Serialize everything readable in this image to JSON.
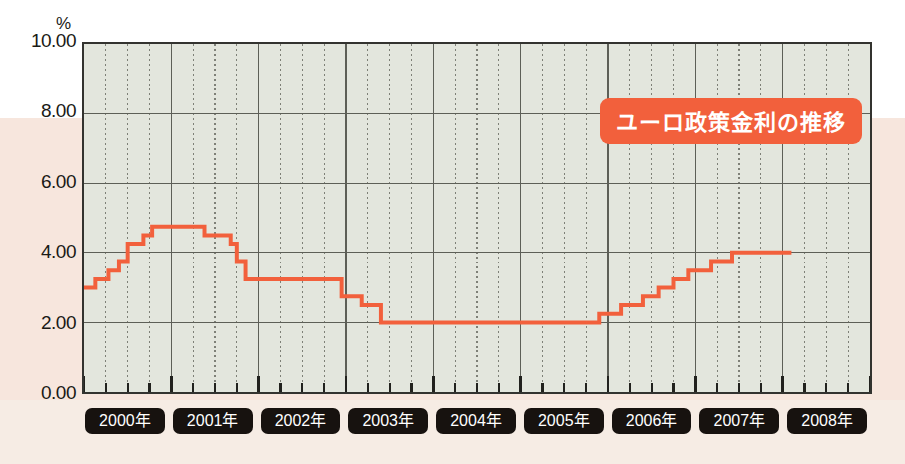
{
  "chart_data": {
    "type": "line",
    "title": "ユーロ政策金利の推移",
    "ylabel": "%",
    "xlabel": "",
    "ylim": [
      0,
      10
    ],
    "yticks": [
      0,
      2,
      4,
      6,
      8,
      10
    ],
    "ytick_labels": [
      "0.00",
      "2.00",
      "4.00",
      "6.00",
      "8.00",
      "10.00"
    ],
    "xlim": [
      2000,
      2009
    ],
    "grid": true,
    "grid_minor": "quarterly",
    "legend": "none",
    "line_color": "#f2603c",
    "plot_background": "#e3e6dd",
    "step_style": "post",
    "categories": [
      "2000年",
      "2001年",
      "2002年",
      "2003年",
      "2004年",
      "2005年",
      "2006年",
      "2007年",
      "2008年"
    ],
    "series": [
      {
        "name": "ユーロ政策金利",
        "unit": "%",
        "points": [
          {
            "x": 2000.0,
            "y": 3.0
          },
          {
            "x": 2000.13,
            "y": 3.25
          },
          {
            "x": 2000.28,
            "y": 3.5
          },
          {
            "x": 2000.4,
            "y": 3.75
          },
          {
            "x": 2000.5,
            "y": 4.25
          },
          {
            "x": 2000.68,
            "y": 4.5
          },
          {
            "x": 2000.78,
            "y": 4.75
          },
          {
            "x": 2001.38,
            "y": 4.5
          },
          {
            "x": 2001.68,
            "y": 4.25
          },
          {
            "x": 2001.75,
            "y": 3.75
          },
          {
            "x": 2001.85,
            "y": 3.25
          },
          {
            "x": 2002.95,
            "y": 2.75
          },
          {
            "x": 2003.18,
            "y": 2.5
          },
          {
            "x": 2003.4,
            "y": 2.0
          },
          {
            "x": 2005.9,
            "y": 2.25
          },
          {
            "x": 2006.15,
            "y": 2.5
          },
          {
            "x": 2006.4,
            "y": 2.75
          },
          {
            "x": 2006.58,
            "y": 3.0
          },
          {
            "x": 2006.75,
            "y": 3.25
          },
          {
            "x": 2006.92,
            "y": 3.5
          },
          {
            "x": 2007.18,
            "y": 3.75
          },
          {
            "x": 2007.42,
            "y": 4.0
          },
          {
            "x": 2008.1,
            "y": 4.0
          }
        ]
      }
    ]
  },
  "axes": {
    "y": {
      "unit_label": "%",
      "ticks": [
        {
          "label": "10.00",
          "value": 10
        },
        {
          "label": "8.00",
          "value": 8
        },
        {
          "label": "6.00",
          "value": 6
        },
        {
          "label": "4.00",
          "value": 4
        },
        {
          "label": "2.00",
          "value": 2
        },
        {
          "label": "0.00",
          "value": 0
        }
      ]
    },
    "x": {
      "ticks": [
        {
          "label": "2000年",
          "value": 2000
        },
        {
          "label": "2001年",
          "value": 2001
        },
        {
          "label": "2002年",
          "value": 2002
        },
        {
          "label": "2003年",
          "value": 2003
        },
        {
          "label": "2004年",
          "value": 2004
        },
        {
          "label": "2005年",
          "value": 2005
        },
        {
          "label": "2006年",
          "value": 2006
        },
        {
          "label": "2007年",
          "value": 2007
        },
        {
          "label": "2008年",
          "value": 2008
        }
      ]
    }
  },
  "colors": {
    "line": "#f2603c",
    "title_badge_bg": "#f2603c",
    "title_badge_text": "#ffffff",
    "plot_bg": "#e3e6dd",
    "chip_bg": "#17120f",
    "chip_text": "#ffffff",
    "page_bg_upper": "#ffffff",
    "page_bg_lower": "#f7e6dd"
  }
}
